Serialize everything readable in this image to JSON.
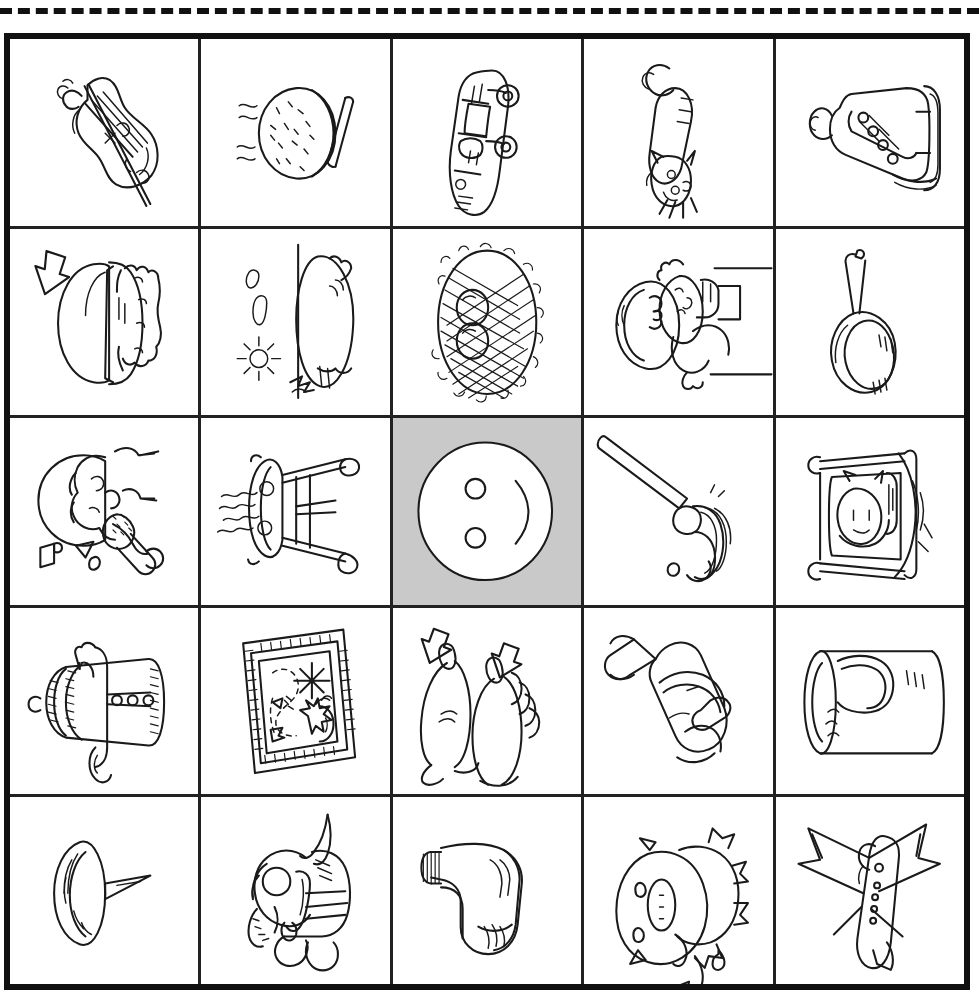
{
  "page": {
    "cut_line_style": "dashed",
    "background_color": "#ffffff",
    "border_color": "#111111",
    "selected_cell_color": "#c9c9c9"
  },
  "grid": {
    "rows": 5,
    "columns": 5,
    "selected_cell": {
      "row": 3,
      "column": 3,
      "label": "button"
    },
    "cells": [
      {
        "row": 1,
        "column": 1,
        "label": "violin",
        "selected": false
      },
      {
        "row": 1,
        "column": 2,
        "label": "cookie with chopsticks",
        "selected": false
      },
      {
        "row": 1,
        "column": 3,
        "label": "car",
        "selected": false
      },
      {
        "row": 1,
        "column": 4,
        "label": "cat",
        "selected": false
      },
      {
        "row": 1,
        "column": 5,
        "label": "ice skate",
        "selected": false
      },
      {
        "row": 2,
        "column": 1,
        "label": "hamburger",
        "selected": false
      },
      {
        "row": 2,
        "column": 2,
        "label": "kite with sun and clouds",
        "selected": false
      },
      {
        "row": 2,
        "column": 3,
        "label": "nest with eggs",
        "selected": false
      },
      {
        "row": 2,
        "column": 4,
        "label": "baby with bottle",
        "selected": false
      },
      {
        "row": 2,
        "column": 5,
        "label": "frying pan",
        "selected": false
      },
      {
        "row": 3,
        "column": 1,
        "label": "singer with microphone",
        "selected": false
      },
      {
        "row": 3,
        "column": 2,
        "label": "stool",
        "selected": false
      },
      {
        "row": 3,
        "column": 3,
        "label": "button",
        "selected": true
      },
      {
        "row": 3,
        "column": 4,
        "label": "mop",
        "selected": false
      },
      {
        "row": 3,
        "column": 5,
        "label": "child in bed",
        "selected": false
      },
      {
        "row": 4,
        "column": 1,
        "label": "coat",
        "selected": false
      },
      {
        "row": 4,
        "column": 2,
        "label": "framed picture",
        "selected": false
      },
      {
        "row": 4,
        "column": 3,
        "label": "feet with toes",
        "selected": false
      },
      {
        "row": 4,
        "column": 4,
        "label": "bell",
        "selected": false
      },
      {
        "row": 4,
        "column": 5,
        "label": "cup",
        "selected": false
      },
      {
        "row": 5,
        "column": 1,
        "label": "tack",
        "selected": false
      },
      {
        "row": 5,
        "column": 2,
        "label": "goat",
        "selected": false
      },
      {
        "row": 5,
        "column": 3,
        "label": "sock",
        "selected": false
      },
      {
        "row": 5,
        "column": 4,
        "label": "pig",
        "selected": false
      },
      {
        "row": 5,
        "column": 5,
        "label": "airplane",
        "selected": false
      }
    ]
  }
}
